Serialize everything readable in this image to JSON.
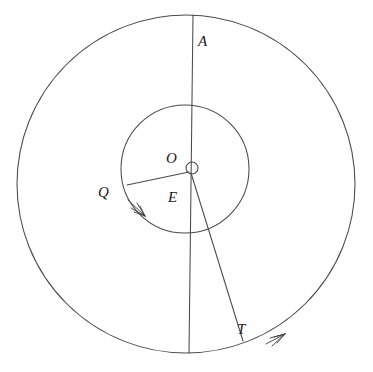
{
  "diagram": {
    "background_color": "#ffffff",
    "stroke_color": "#4a4a4a",
    "label_color": "#1a1a1a",
    "labels": {
      "apogee": "A",
      "center": "O",
      "earth": "E",
      "quadrature": "Q",
      "tangent": "T"
    },
    "geometry": {
      "center": [
        186,
        184
      ],
      "outer_circle": {
        "cx": 186,
        "cy": 184,
        "r": 169
      },
      "inner_circle": {
        "cx": 185,
        "cy": 169,
        "r": 64
      },
      "hub_circle": {
        "cx": 192,
        "cy": 168,
        "r": 6
      },
      "axis_line": {
        "x1": 193,
        "y1": 15,
        "x2": 189,
        "y2": 353
      },
      "radius_q": {
        "x1": 190,
        "y1": 172,
        "x2": 127,
        "y2": 185
      },
      "radius_t": {
        "x1": 191,
        "y1": 173,
        "x2": 243,
        "y2": 341
      }
    },
    "arrows": [
      {
        "name": "inner-tangent-arrow",
        "at": [
          141,
          213
        ],
        "direction": "clockwise-down-right"
      },
      {
        "name": "outer-tangent-arrow",
        "at": [
          281,
          338
        ],
        "direction": "clockwise-up-right"
      }
    ]
  }
}
